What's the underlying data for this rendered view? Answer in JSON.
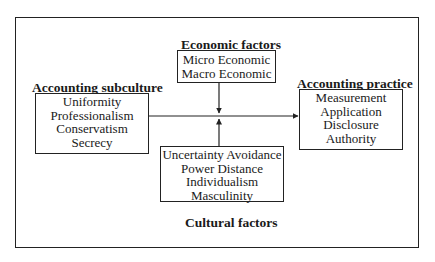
{
  "diagram": {
    "economic": {
      "title": "Economic factors",
      "items": [
        "Micro Economic",
        "Macro Economic"
      ]
    },
    "subculture": {
      "title": "Accounting subculture",
      "items": [
        "Uniformity",
        "Professionalism",
        "Conservatism",
        "Secrecy"
      ]
    },
    "practice": {
      "title": "Accounting practice",
      "items": [
        "Measurement",
        "Application",
        "Disclosure",
        "Authority"
      ]
    },
    "cultural": {
      "title": "Cultural factors",
      "items": [
        "Uncertainty Avoidance",
        "Power Distance",
        "Individualism",
        "Masculinity"
      ]
    },
    "edges": [
      {
        "from": "subculture",
        "to": "practice"
      },
      {
        "from": "economic",
        "to": "subculture-practice-link"
      },
      {
        "from": "cultural",
        "to": "subculture-practice-link"
      }
    ]
  }
}
